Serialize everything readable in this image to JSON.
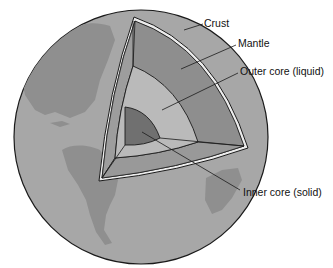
{
  "diagram": {
    "labels": {
      "crust": "Crust",
      "mantle": "Mantle",
      "outer_core": "Outer core (liquid)",
      "inner_core": "Inner core (solid)"
    },
    "colors": {
      "ocean": "#a6a6a6",
      "land": "#8f8f8f",
      "crust": "#ececec",
      "mantle": "#8c8c8c",
      "mantle_side": "#9b9b9b",
      "outer_core": "#b9b9b9",
      "inner_core": "#6f6f6f",
      "outline": "#1a1a1a"
    }
  }
}
